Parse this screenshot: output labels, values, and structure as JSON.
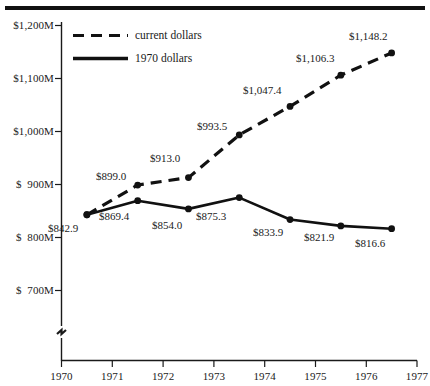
{
  "chart_data": {
    "type": "line",
    "title": "",
    "subtitle": "",
    "xlabel": "",
    "ylabel": "",
    "x": [
      1970.5,
      1971.5,
      1972.5,
      1973.5,
      1974.5,
      1975.5,
      1976.5
    ],
    "xlim": [
      1970,
      1977
    ],
    "ylim": [
      660,
      1200
    ],
    "y_axis_break": true,
    "grid": false,
    "legend_position": "top-left-inside",
    "x_tick_labels": [
      "1970",
      "1971",
      "1972",
      "1973",
      "1974",
      "1975",
      "1976",
      "1977"
    ],
    "x_tick_values": [
      1970,
      1971,
      1972,
      1973,
      1974,
      1975,
      1976,
      1977
    ],
    "y_tick_labels": [
      "$1,200M",
      "$1,100M",
      "$1,000M",
      "$  900M",
      "$  800M",
      "$  700M"
    ],
    "y_tick_values": [
      1200,
      1100,
      1000,
      900,
      800,
      700
    ],
    "series": [
      {
        "name": "current dollars",
        "style": "dashed",
        "color": "#111111",
        "values": [
          842.9,
          899.0,
          913.0,
          993.5,
          1047.4,
          1106.3,
          1148.2
        ],
        "data_labels": [
          "$842.9",
          "$899.0",
          "$913.0",
          "$993.5",
          "$1,047.4",
          "$1,106.3",
          "$1,148.2"
        ]
      },
      {
        "name": "1970 dollars",
        "style": "solid",
        "color": "#111111",
        "values": [
          842.9,
          869.4,
          854.0,
          875.3,
          833.9,
          821.9,
          816.6
        ],
        "data_labels": [
          "$842.9",
          "$869.4",
          "$854.0",
          "$875.3",
          "$833.9",
          "$821.9",
          "$816.6"
        ]
      }
    ]
  },
  "legend": {
    "items": [
      {
        "label": "current dollars",
        "style": "dashed"
      },
      {
        "label": "1970 dollars",
        "style": "solid"
      }
    ]
  },
  "y_labels": {
    "t0": "$1,200M",
    "t1": "$1,100M",
    "t2": "$1,000M",
    "t3": "$  900M",
    "t4": "$  800M",
    "t5": "$  700M"
  },
  "x_labels": {
    "t0": "1970",
    "t1": "1971",
    "t2": "1972",
    "t3": "1973",
    "t4": "1974",
    "t5": "1975",
    "t6": "1976",
    "t7": "1977"
  },
  "current_labels": {
    "p0": "$842.9",
    "p1": "$899.0",
    "p2": "$913.0",
    "p3": "$993.5",
    "p4": "$1,047.4",
    "p5": "$1,106.3",
    "p6": "$1,148.2"
  },
  "constant_labels": {
    "p1": "$869.4",
    "p2": "$854.0",
    "p3": "$875.3",
    "p4": "$833.9",
    "p5": "$821.9",
    "p6": "$816.6"
  }
}
